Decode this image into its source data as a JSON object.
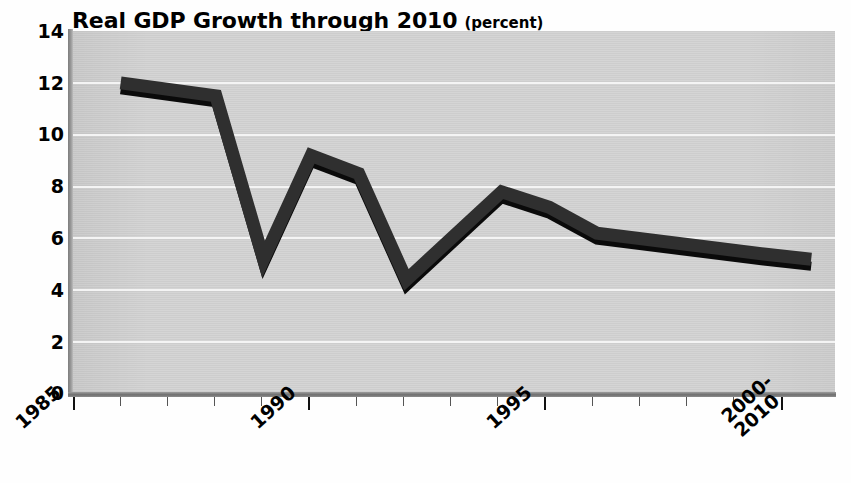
{
  "figure": {
    "title_main": "Real GDP Growth through 2010",
    "title_sub": "(percent)",
    "background": "#d4d4d4",
    "line_color": "#2b2b2b",
    "shadow_color": "#000000",
    "gridline_color": "#f4f4f4"
  },
  "chart_data": {
    "type": "line",
    "title": "Real GDP Growth through 2010 (percent)",
    "xlabel": "",
    "ylabel": "percent",
    "ylim": [
      0,
      14
    ],
    "ytick_labels": [
      "0",
      "2",
      "4",
      "6",
      "8",
      "10",
      "12",
      "14"
    ],
    "yticks": [
      0,
      2,
      4,
      6,
      8,
      10,
      12,
      14
    ],
    "xtick_labels": [
      "1985",
      "1990",
      "1995",
      "2000-\n2010"
    ],
    "xticks": [
      1985,
      1990,
      1995,
      2000
    ],
    "xlim": [
      1985,
      2001
    ],
    "grid": true,
    "legend": false,
    "series": [
      {
        "name": "Real GDP growth",
        "x": [
          1986,
          1988,
          1989,
          1990,
          1991,
          1992,
          1994,
          1995,
          1996,
          1999.5,
          2000.5
        ],
        "values": [
          12.0,
          11.5,
          5.2,
          9.2,
          8.5,
          4.4,
          7.8,
          7.2,
          6.2,
          5.4,
          5.2
        ]
      }
    ]
  },
  "y_axis": {
    "ticks": [
      {
        "label": "14",
        "value": 14
      },
      {
        "label": "12",
        "value": 12
      },
      {
        "label": "10",
        "value": 10
      },
      {
        "label": "8",
        "value": 8
      },
      {
        "label": "6",
        "value": 6
      },
      {
        "label": "4",
        "value": 4
      },
      {
        "label": "2",
        "value": 2
      },
      {
        "label": "0",
        "value": 0
      }
    ]
  },
  "x_axis": {
    "labels": [
      {
        "line1": "1985",
        "line2": ""
      },
      {
        "line1": "1990",
        "line2": ""
      },
      {
        "line1": "1995",
        "line2": ""
      },
      {
        "line1": "2000-",
        "line2": "2010"
      }
    ]
  }
}
